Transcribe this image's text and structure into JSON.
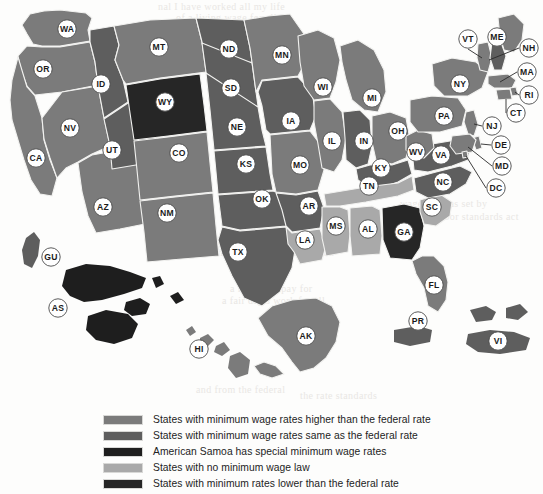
{
  "page": {
    "background_color": "#fdfdfc"
  },
  "palette": {
    "higher_than_federal": "#7b7b7b",
    "same_as_federal": "#5e5e5e",
    "american_samoa_special": "#1e1e1e",
    "no_minimum_wage_law": "#a9a9a9",
    "lower_than_federal": "#262626",
    "border": "#f2f2f0",
    "label_fill": "#ffffff",
    "label_stroke": "#4a4a4a",
    "leader_line": "#2a2a2a",
    "text": "#232323"
  },
  "legend": {
    "items": [
      {
        "swatch_color": "#7b7b7b",
        "label": "States with minimum wage rates higher than the federal rate",
        "key": "higher_than_federal"
      },
      {
        "swatch_color": "#5e5e5e",
        "label": "States with minimum wage rates same as the federal rate",
        "key": "same_as_federal"
      },
      {
        "swatch_color": "#1e1e1e",
        "label": "American Samoa has special minimum wage rates",
        "key": "american_samoa_special"
      },
      {
        "swatch_color": "#a9a9a9",
        "label": "States with no minimum wage law",
        "key": "no_minimum_wage_law"
      },
      {
        "swatch_color": "#262626",
        "label": "States with minimum rates lower than the federal rate",
        "key": "lower_than_federal"
      }
    ]
  },
  "bleed_text": {
    "b1": "nal I have worked all my life",
    "b2": "of a living wage for all",
    "b3": "the minimum wage at a level to",
    "b4": "and the prosperity of the nation",
    "b5": "a fair day's pay for",
    "b6": "a fair day's work for all",
    "b7": "and from the federal",
    "b8": "the rate standards",
    "b9": "wage rates as set by",
    "b10": "the labor standards act"
  },
  "map": {
    "states": [
      {
        "code": "WA",
        "category": "higher_than_federal",
        "label_x": 67,
        "label_y": 29
      },
      {
        "code": "OR",
        "category": "higher_than_federal",
        "label_x": 43,
        "label_y": 69
      },
      {
        "code": "CA",
        "category": "higher_than_federal",
        "label_x": 36,
        "label_y": 158
      },
      {
        "code": "NV",
        "category": "higher_than_federal",
        "label_x": 70,
        "label_y": 128
      },
      {
        "code": "AZ",
        "category": "higher_than_federal",
        "label_x": 103,
        "label_y": 207
      },
      {
        "code": "ID",
        "category": "same_as_federal",
        "label_x": 101,
        "label_y": 84
      },
      {
        "code": "UT",
        "category": "same_as_federal",
        "label_x": 112,
        "label_y": 150
      },
      {
        "code": "MT",
        "category": "higher_than_federal",
        "label_x": 159,
        "label_y": 47
      },
      {
        "code": "WY",
        "category": "lower_than_federal",
        "label_x": 165,
        "label_y": 102
      },
      {
        "code": "CO",
        "category": "higher_than_federal",
        "label_x": 179,
        "label_y": 153
      },
      {
        "code": "NM",
        "category": "higher_than_federal",
        "label_x": 167,
        "label_y": 213
      },
      {
        "code": "ND",
        "category": "same_as_federal",
        "label_x": 229,
        "label_y": 49
      },
      {
        "code": "SD",
        "category": "same_as_federal",
        "label_x": 231,
        "label_y": 88
      },
      {
        "code": "NE",
        "category": "same_as_federal",
        "label_x": 237,
        "label_y": 127
      },
      {
        "code": "KS",
        "category": "same_as_federal",
        "label_x": 246,
        "label_y": 164
      },
      {
        "code": "OK",
        "category": "same_as_federal",
        "label_x": 262,
        "label_y": 199
      },
      {
        "code": "TX",
        "category": "same_as_federal",
        "label_x": 238,
        "label_y": 252
      },
      {
        "code": "MN",
        "category": "higher_than_federal",
        "label_x": 282,
        "label_y": 55
      },
      {
        "code": "IA",
        "category": "same_as_federal",
        "label_x": 291,
        "label_y": 121
      },
      {
        "code": "MO",
        "category": "higher_than_federal",
        "label_x": 300,
        "label_y": 165
      },
      {
        "code": "AR",
        "category": "same_as_federal",
        "label_x": 309,
        "label_y": 206
      },
      {
        "code": "LA",
        "category": "no_minimum_wage_law",
        "label_x": 305,
        "label_y": 240
      },
      {
        "code": "WI",
        "category": "higher_than_federal",
        "label_x": 323,
        "label_y": 87
      },
      {
        "code": "IL",
        "category": "higher_than_federal",
        "label_x": 332,
        "label_y": 141
      },
      {
        "code": "IN",
        "category": "same_as_federal",
        "label_x": 364,
        "label_y": 141
      },
      {
        "code": "MI",
        "category": "higher_than_federal",
        "label_x": 372,
        "label_y": 98
      },
      {
        "code": "OH",
        "category": "higher_than_federal",
        "label_x": 398,
        "label_y": 131
      },
      {
        "code": "KY",
        "category": "same_as_federal",
        "label_x": 381,
        "label_y": 168
      },
      {
        "code": "TN",
        "category": "no_minimum_wage_law",
        "label_x": 369,
        "label_y": 186
      },
      {
        "code": "MS",
        "category": "no_minimum_wage_law",
        "label_x": 336,
        "label_y": 226
      },
      {
        "code": "AL",
        "category": "no_minimum_wage_law",
        "label_x": 368,
        "label_y": 229
      },
      {
        "code": "GA",
        "category": "lower_than_federal",
        "label_x": 404,
        "label_y": 232
      },
      {
        "code": "FL",
        "category": "higher_than_federal",
        "label_x": 434,
        "label_y": 285
      },
      {
        "code": "SC",
        "category": "no_minimum_wage_law",
        "label_x": 432,
        "label_y": 207
      },
      {
        "code": "NC",
        "category": "same_as_federal",
        "label_x": 443,
        "label_y": 182
      },
      {
        "code": "VA",
        "category": "same_as_federal",
        "label_x": 441,
        "label_y": 155
      },
      {
        "code": "WV",
        "category": "higher_than_federal",
        "label_x": 416,
        "label_y": 152
      },
      {
        "code": "PA",
        "category": "higher_than_federal",
        "label_x": 444,
        "label_y": 116
      },
      {
        "code": "NY",
        "category": "higher_than_federal",
        "label_x": 460,
        "label_y": 84
      },
      {
        "code": "VT",
        "category": "higher_than_federal",
        "label_x": 468,
        "label_y": 39
      },
      {
        "code": "ME",
        "category": "higher_than_federal",
        "label_x": 497,
        "label_y": 37
      },
      {
        "code": "NH",
        "category": "same_as_federal",
        "label_x": 529,
        "label_y": 48
      },
      {
        "code": "MA",
        "category": "higher_than_federal",
        "label_x": 527,
        "label_y": 72
      },
      {
        "code": "RI",
        "category": "higher_than_federal",
        "label_x": 529,
        "label_y": 95
      },
      {
        "code": "CT",
        "category": "higher_than_federal",
        "label_x": 516,
        "label_y": 113
      },
      {
        "code": "NJ",
        "category": "higher_than_federal",
        "label_x": 492,
        "label_y": 126
      },
      {
        "code": "DE",
        "category": "higher_than_federal",
        "label_x": 501,
        "label_y": 145
      },
      {
        "code": "MD",
        "category": "higher_than_federal",
        "label_x": 502,
        "label_y": 166
      },
      {
        "code": "DC",
        "category": "higher_than_federal",
        "label_x": 496,
        "label_y": 188
      },
      {
        "code": "AK",
        "category": "higher_than_federal",
        "label_x": 306,
        "label_y": 336
      },
      {
        "code": "HI",
        "category": "higher_than_federal",
        "label_x": 199,
        "label_y": 349
      },
      {
        "code": "GU",
        "category": "same_as_federal",
        "label_x": 51,
        "label_y": 257
      },
      {
        "code": "AS",
        "category": "american_samoa_special",
        "label_x": 58,
        "label_y": 308
      },
      {
        "code": "PR",
        "category": "same_as_federal",
        "label_x": 418,
        "label_y": 321
      },
      {
        "code": "VI",
        "category": "same_as_federal",
        "label_x": 498,
        "label_y": 341
      }
    ]
  }
}
